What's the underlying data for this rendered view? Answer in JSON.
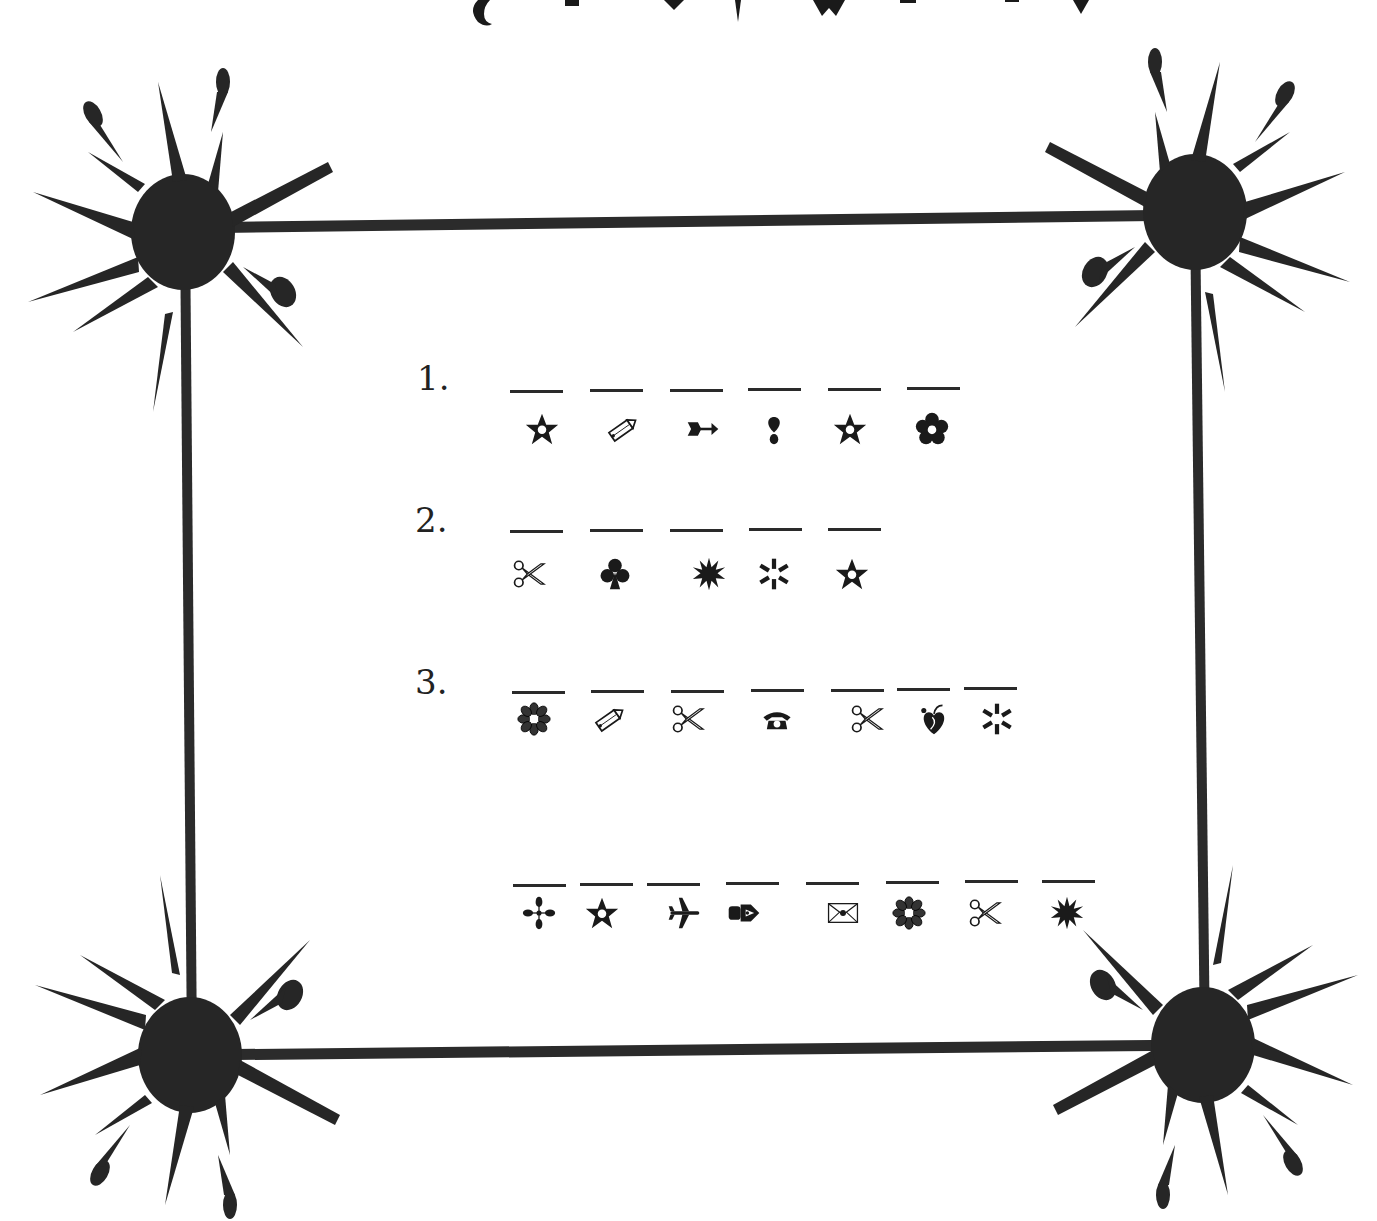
{
  "page": {
    "type": "symbol-code worksheet",
    "colors": {
      "ink": "#1a1a1a",
      "frame": "#2b2b2b",
      "paper": "#ffffff"
    },
    "top_cut_glyphs": [
      "snail",
      "square",
      "heart",
      "dagger",
      "diamond-pair",
      "script",
      "dash",
      "heart-small"
    ]
  },
  "questions": [
    {
      "number": "1.",
      "blanks": 6,
      "symbols": [
        "star-outline",
        "pencil-icon",
        "arrow-icon",
        "drop-exclaim-icon",
        "star-outline",
        "flower-filled-icon"
      ]
    },
    {
      "number": "2.",
      "blanks": 5,
      "symbols": [
        "scissors-icon",
        "club-icon",
        "starburst-icon",
        "asterisk-spark-icon",
        "star-outline"
      ]
    },
    {
      "number": "3.",
      "blanks": 7,
      "symbols": [
        "flower-outline-icon",
        "pencil-icon",
        "scissors-icon",
        "telephone-icon",
        "scissors-icon",
        "apple-heart-icon",
        "asterisk-spark-icon"
      ]
    },
    {
      "number": "",
      "blanks": 8,
      "symbols": [
        "cross-dots-icon",
        "star-outline",
        "airplane-icon",
        "pen-nib-icon",
        "envelope-icon",
        "flower-outline-icon",
        "scissors-icon",
        "starburst-icon"
      ]
    }
  ]
}
